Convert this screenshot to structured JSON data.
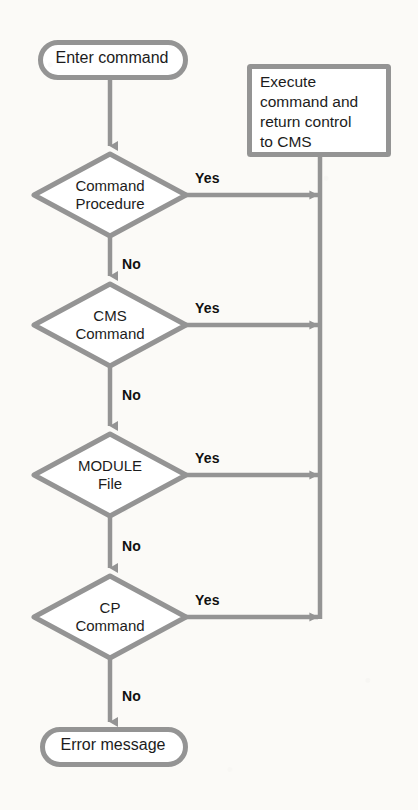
{
  "diagram": {
    "canvas": {
      "width": 418,
      "height": 810
    },
    "colors": {
      "background": "#fbfaf7",
      "stroke": "#949494",
      "stroke_dark": "#7e7e7e",
      "shape_fill": "#ffffff",
      "text": "#1c1c1c",
      "label_text": "#111111"
    },
    "nodes": {
      "start_terminal": {
        "shape": "terminal",
        "text": "Enter command",
        "x": 38,
        "y": 40,
        "width": 148,
        "height": 39
      },
      "process_execute": {
        "shape": "process",
        "text": "Execute\ncommand and\nreturn control\nto CMS",
        "x": 247,
        "y": 64,
        "width": 143,
        "height": 92
      },
      "decision_command_procedure": {
        "shape": "decision",
        "text": "Command\nProcedure",
        "cx": 110,
        "cy": 195,
        "rx": 78,
        "ry": 43
      },
      "decision_cms_command": {
        "shape": "decision",
        "text": "CMS\nCommand",
        "cx": 110,
        "cy": 325,
        "rx": 78,
        "ry": 43
      },
      "decision_module_file": {
        "shape": "decision",
        "text": "MODULE\nFile",
        "cx": 110,
        "cy": 475,
        "rx": 78,
        "ry": 43
      },
      "decision_cp_command": {
        "shape": "decision",
        "text": "CP\nCommand",
        "cx": 110,
        "cy": 617,
        "rx": 78,
        "ry": 43
      },
      "end_terminal": {
        "shape": "terminal",
        "text": "Error message",
        "x": 40,
        "y": 727,
        "width": 146,
        "height": 39
      }
    },
    "edge_labels": [
      {
        "name": "yes-command-procedure",
        "text": "Yes",
        "x": 195,
        "y": 170
      },
      {
        "name": "no-command-procedure",
        "text": "No",
        "x": 122,
        "y": 256
      },
      {
        "name": "yes-cms-command",
        "text": "Yes",
        "x": 195,
        "y": 300
      },
      {
        "name": "no-cms-command",
        "text": "No",
        "x": 122,
        "y": 387
      },
      {
        "name": "yes-module-file",
        "text": "Yes",
        "x": 195,
        "y": 450
      },
      {
        "name": "no-module-file",
        "text": "No",
        "x": 122,
        "y": 538
      },
      {
        "name": "yes-cp-command",
        "text": "Yes",
        "x": 195,
        "y": 592
      },
      {
        "name": "no-cp-command",
        "text": "No",
        "x": 122,
        "y": 688
      }
    ],
    "return_rail": {
      "x": 320,
      "y_top": 156,
      "y_bottom": 617
    }
  }
}
